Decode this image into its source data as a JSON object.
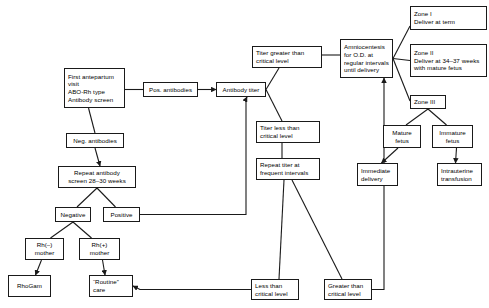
{
  "diagram": {
    "stroke_color": "#1a1a1a",
    "background_color": "#ffffff",
    "nodes": [
      {
        "id": "first_visit",
        "label": "First antepartum\nvisit\nABO-Rh type\nAntibody screen",
        "x": 64,
        "y": 68,
        "w": 61,
        "h": 40,
        "align": "left"
      },
      {
        "id": "pos_antibodies",
        "label": "Pos. antibodies",
        "x": 143,
        "y": 82,
        "w": 55,
        "h": 15,
        "align": "center"
      },
      {
        "id": "antibody_titer",
        "label": "Antibody titer",
        "x": 216,
        "y": 82,
        "w": 50,
        "h": 15,
        "align": "center"
      },
      {
        "id": "titer_greater",
        "label": "Titer greater than\ncritical level",
        "x": 252,
        "y": 46,
        "w": 70,
        "h": 22,
        "align": "left"
      },
      {
        "id": "amniocentesis",
        "label": "Amniocentesis\nfor O.D. at\nregular intervals\nuntil delivery",
        "x": 340,
        "y": 39,
        "w": 53,
        "h": 39,
        "align": "left"
      },
      {
        "id": "zone_1",
        "label": "Zone I\nDeliver at term",
        "x": 410,
        "y": 6,
        "w": 77,
        "h": 24,
        "align": "left"
      },
      {
        "id": "zone_2",
        "label": "Zone II\nDeliver at 34–37 weeks\nwith mature fetus",
        "x": 410,
        "y": 44,
        "w": 77,
        "h": 33,
        "align": "left"
      },
      {
        "id": "zone_3",
        "label": "Zone III",
        "x": 410,
        "y": 95,
        "w": 36,
        "h": 14,
        "align": "left"
      },
      {
        "id": "mature_fetus",
        "label": "Mature\nfetus",
        "x": 383,
        "y": 125,
        "w": 38,
        "h": 23,
        "align": "center"
      },
      {
        "id": "immature_fetus",
        "label": "Immature\nfetus",
        "x": 432,
        "y": 125,
        "w": 41,
        "h": 23,
        "align": "center"
      },
      {
        "id": "immediate_delivery",
        "label": "Immediate\ndelivery",
        "x": 357,
        "y": 163,
        "w": 41,
        "h": 23,
        "align": "left"
      },
      {
        "id": "iu_transfusion",
        "label": "Intrauterine\ntransfusion",
        "x": 437,
        "y": 163,
        "w": 45,
        "h": 23,
        "align": "left"
      },
      {
        "id": "titer_less",
        "label": "Titer less than\ncritical level",
        "x": 256,
        "y": 121,
        "w": 64,
        "h": 22,
        "align": "left"
      },
      {
        "id": "repeat_titer",
        "label": "Repeat titer at\nfrequent intervals",
        "x": 256,
        "y": 158,
        "w": 64,
        "h": 22,
        "align": "left"
      },
      {
        "id": "neg_antibodies",
        "label": "Neg. antibodies",
        "x": 66,
        "y": 133,
        "w": 58,
        "h": 15,
        "align": "center"
      },
      {
        "id": "repeat_antibody",
        "label": "Repeat antibody\nscreen 28–30 weeks",
        "x": 58,
        "y": 166,
        "w": 78,
        "h": 22,
        "align": "center"
      },
      {
        "id": "negative",
        "label": "Negative",
        "x": 55,
        "y": 207,
        "w": 36,
        "h": 15,
        "align": "center"
      },
      {
        "id": "positive",
        "label": "Positive",
        "x": 103,
        "y": 207,
        "w": 37,
        "h": 15,
        "align": "center"
      },
      {
        "id": "rh_neg_mother",
        "label": "Rh(–)\nmother",
        "x": 25,
        "y": 238,
        "w": 39,
        "h": 22,
        "align": "center"
      },
      {
        "id": "rh_pos_mother",
        "label": "Rh(+)\nmother",
        "x": 79,
        "y": 238,
        "w": 41,
        "h": 22,
        "align": "center"
      },
      {
        "id": "rhogam",
        "label": "RhoGam",
        "x": 8,
        "y": 275,
        "w": 43,
        "h": 22,
        "align": "center"
      },
      {
        "id": "routine_care",
        "label": "“Routine”\ncare",
        "x": 89,
        "y": 275,
        "w": 44,
        "h": 22,
        "align": "left"
      },
      {
        "id": "less_than_crit",
        "label": "Less than\ncritical level",
        "x": 251,
        "y": 279,
        "w": 48,
        "h": 21,
        "align": "left"
      },
      {
        "id": "greater_than_crit",
        "label": "Greater than\ncritical level",
        "x": 324,
        "y": 279,
        "w": 48,
        "h": 21,
        "align": "left"
      }
    ],
    "edges": [
      {
        "from": "first_visit",
        "to": "pos_antibodies",
        "arrow": false
      },
      {
        "from": "pos_antibodies",
        "to": "antibody_titer",
        "arrow": true
      },
      {
        "from": "antibody_titer",
        "to": "titer_greater",
        "arrow": false
      },
      {
        "from": "antibody_titer",
        "to": "titer_less",
        "arrow": false
      },
      {
        "from": "titer_greater",
        "to": "amniocentesis",
        "arrow": false
      },
      {
        "from": "amniocentesis",
        "to": "zone_1",
        "arrow": false
      },
      {
        "from": "amniocentesis",
        "to": "zone_2",
        "arrow": false
      },
      {
        "from": "amniocentesis",
        "to": "zone_3",
        "arrow": false
      },
      {
        "from": "zone_3",
        "to": "mature_fetus",
        "arrow": false
      },
      {
        "from": "zone_3",
        "to": "immature_fetus",
        "arrow": false
      },
      {
        "from": "mature_fetus",
        "to": "immediate_delivery",
        "arrow": true
      },
      {
        "from": "immature_fetus",
        "to": "iu_transfusion",
        "arrow": true
      },
      {
        "from": "titer_less",
        "to": "repeat_titer",
        "arrow": false
      },
      {
        "from": "repeat_titer",
        "to": "less_than_crit",
        "arrow": false
      },
      {
        "from": "repeat_titer",
        "to": "greater_than_crit",
        "arrow": false
      },
      {
        "from": "less_than_crit",
        "to": "routine_care",
        "arrow": true
      },
      {
        "from": "greater_than_crit",
        "to": "amniocentesis",
        "arrow": true
      },
      {
        "from": "first_visit",
        "to": "neg_antibodies",
        "arrow": false
      },
      {
        "from": "neg_antibodies",
        "to": "repeat_antibody",
        "arrow": true
      },
      {
        "from": "repeat_antibody",
        "to": "negative",
        "arrow": false
      },
      {
        "from": "repeat_antibody",
        "to": "positive",
        "arrow": false
      },
      {
        "from": "positive",
        "to": "antibody_titer",
        "arrow": true
      },
      {
        "from": "negative",
        "to": "rh_neg_mother",
        "arrow": false
      },
      {
        "from": "negative",
        "to": "rh_pos_mother",
        "arrow": false
      },
      {
        "from": "rh_neg_mother",
        "to": "rhogam",
        "arrow": true
      },
      {
        "from": "rh_pos_mother",
        "to": "routine_care",
        "arrow": true
      }
    ]
  }
}
